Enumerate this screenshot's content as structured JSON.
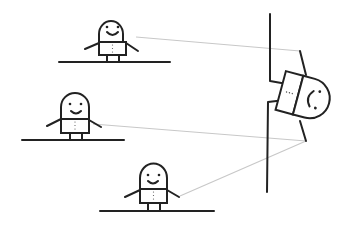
{
  "scene": {
    "title": "",
    "description": "Three standing smiley figures on floor lines connected by light gray lines to a figure mounted sideways on a vertical wall",
    "figures": [
      {
        "name": "figure-top",
        "expression": "smile"
      },
      {
        "name": "figure-middle",
        "expression": "smile"
      },
      {
        "name": "figure-bottom",
        "expression": "smile"
      }
    ],
    "wall_figure": {
      "name": "wall-figure",
      "expression": "smile",
      "orientation": "rotated"
    },
    "colors": {
      "line": "#222222",
      "connector": "#c8c8c8",
      "background": "#ffffff"
    }
  }
}
